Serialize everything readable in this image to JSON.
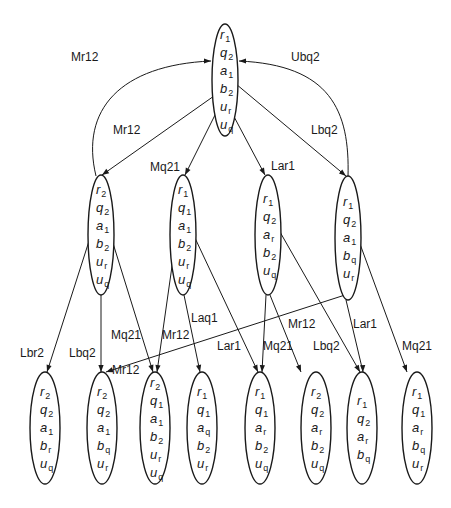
{
  "diagram": {
    "type": "state-transition-tree",
    "colors": {
      "stroke": "#1a1a1a",
      "background": "#ffffff"
    },
    "nodes": [
      {
        "id": "root",
        "cx": 225,
        "cy": 80,
        "rx": 13,
        "ry": 56,
        "vars": [
          [
            "r",
            "1"
          ],
          [
            "q",
            "2"
          ],
          [
            "a",
            "1"
          ],
          [
            "b",
            "2"
          ],
          [
            "u",
            "r"
          ],
          [
            "u",
            "q"
          ]
        ]
      },
      {
        "id": "m1",
        "cx": 101,
        "cy": 235,
        "rx": 13,
        "ry": 60,
        "vars": [
          [
            "r",
            "2"
          ],
          [
            "q",
            "2"
          ],
          [
            "a",
            "1"
          ],
          [
            "b",
            "2"
          ],
          [
            "u",
            "r"
          ],
          [
            "u",
            "q"
          ]
        ]
      },
      {
        "id": "m2",
        "cx": 183,
        "cy": 235,
        "rx": 13,
        "ry": 60,
        "vars": [
          [
            "r",
            "1"
          ],
          [
            "q",
            "1"
          ],
          [
            "a",
            "1"
          ],
          [
            "b",
            "2"
          ],
          [
            "u",
            "r"
          ],
          [
            "u",
            "q"
          ]
        ]
      },
      {
        "id": "m3",
        "cx": 268,
        "cy": 235,
        "rx": 13,
        "ry": 60,
        "vars": [
          [
            "r",
            "1"
          ],
          [
            "q",
            "2"
          ],
          [
            "a",
            "r"
          ],
          [
            "b",
            "2"
          ],
          [
            "u",
            "q"
          ]
        ]
      },
      {
        "id": "m4",
        "cx": 348,
        "cy": 238,
        "rx": 13,
        "ry": 62,
        "vars": [
          [
            "r",
            "1"
          ],
          [
            "q",
            "2"
          ],
          [
            "a",
            "1"
          ],
          [
            "b",
            "q"
          ],
          [
            "u",
            "r"
          ]
        ]
      },
      {
        "id": "b1",
        "cx": 45,
        "cy": 428,
        "rx": 15,
        "ry": 56,
        "vars": [
          [
            "r",
            "2"
          ],
          [
            "q",
            "2"
          ],
          [
            "a",
            "1"
          ],
          [
            "b",
            "r"
          ],
          [
            "u",
            "q"
          ]
        ]
      },
      {
        "id": "b2",
        "cx": 102,
        "cy": 428,
        "rx": 15,
        "ry": 56,
        "vars": [
          [
            "r",
            "2"
          ],
          [
            "q",
            "2"
          ],
          [
            "a",
            "1"
          ],
          [
            "b",
            "q"
          ],
          [
            "u",
            "r"
          ]
        ]
      },
      {
        "id": "b3",
        "cx": 155,
        "cy": 428,
        "rx": 15,
        "ry": 56,
        "vars": [
          [
            "r",
            "2"
          ],
          [
            "q",
            "1"
          ],
          [
            "a",
            "1"
          ],
          [
            "b",
            "2"
          ],
          [
            "u",
            "r"
          ],
          [
            "u",
            "q"
          ]
        ]
      },
      {
        "id": "b4",
        "cx": 202,
        "cy": 428,
        "rx": 15,
        "ry": 56,
        "vars": [
          [
            "r",
            "1"
          ],
          [
            "q",
            "1"
          ],
          [
            "a",
            "q"
          ],
          [
            "b",
            "2"
          ],
          [
            "u",
            "r"
          ]
        ]
      },
      {
        "id": "b5",
        "cx": 260,
        "cy": 428,
        "rx": 15,
        "ry": 56,
        "vars": [
          [
            "r",
            "1"
          ],
          [
            "q",
            "1"
          ],
          [
            "a",
            "r"
          ],
          [
            "b",
            "2"
          ],
          [
            "u",
            "q"
          ]
        ]
      },
      {
        "id": "b6",
        "cx": 316,
        "cy": 428,
        "rx": 15,
        "ry": 56,
        "vars": [
          [
            "r",
            "2"
          ],
          [
            "q",
            "2"
          ],
          [
            "a",
            "r"
          ],
          [
            "b",
            "2"
          ],
          [
            "u",
            "q"
          ]
        ]
      },
      {
        "id": "b7",
        "cx": 362,
        "cy": 428,
        "rx": 15,
        "ry": 56,
        "vars": [
          [
            "r",
            "1"
          ],
          [
            "q",
            "2"
          ],
          [
            "a",
            "r"
          ],
          [
            "b",
            "q"
          ]
        ]
      },
      {
        "id": "b8",
        "cx": 417,
        "cy": 428,
        "rx": 15,
        "ry": 56,
        "vars": [
          [
            "r",
            "1"
          ],
          [
            "q",
            "1"
          ],
          [
            "a",
            "r"
          ],
          [
            "b",
            "q"
          ],
          [
            "u",
            "r"
          ]
        ]
      }
    ],
    "edges": [
      {
        "label": "Mr12",
        "path": "M96,176 C80,110 120,65 211,61",
        "arrow_at": [
          211,
          61
        ],
        "arrow_dir": [
          1,
          0
        ],
        "label_pos": [
          71,
          61
        ]
      },
      {
        "label": "Ubq2",
        "path": "M348,177 C350,110 330,65 239,61",
        "arrow_at": [
          239,
          61
        ],
        "arrow_dir": [
          -1,
          0
        ],
        "label_pos": [
          291,
          61
        ]
      },
      {
        "label": "Mr12",
        "path": "M214,96 L102,175",
        "arrow_at": [
          102,
          175
        ],
        "arrow_dir": [
          -0.82,
          0.57
        ],
        "label_pos": [
          113,
          134
        ]
      },
      {
        "label": "Mq21",
        "path": "M216,113 L185,175",
        "arrow_at": [
          185,
          175
        ],
        "arrow_dir": [
          -0.45,
          0.89
        ],
        "label_pos": [
          150,
          171
        ]
      },
      {
        "label": "Lar1",
        "path": "M231,111 L265,175",
        "arrow_at": [
          265,
          175
        ],
        "arrow_dir": [
          0.47,
          0.88
        ],
        "label_pos": [
          271,
          170
        ]
      },
      {
        "label": "Lbq2",
        "path": "M236,84 L346,176",
        "arrow_at": [
          346,
          176
        ],
        "arrow_dir": [
          0.77,
          0.64
        ],
        "label_pos": [
          311,
          134
        ]
      },
      {
        "label": "Lbr2",
        "path": "M90,238 L47,372",
        "arrow_at": [
          47,
          372
        ],
        "arrow_dir": [
          -0.3,
          0.95
        ],
        "label_pos": [
          20,
          357
        ]
      },
      {
        "label": "Lbq2",
        "path": "M101,295 L101,372",
        "arrow_at": [
          101,
          372
        ],
        "arrow_dir": [
          0,
          1
        ],
        "label_pos": [
          69,
          357
        ]
      },
      {
        "label": "Mq21",
        "path": "M112,240 L153,372",
        "arrow_at": [
          153,
          372
        ],
        "arrow_dir": [
          0.3,
          0.95
        ],
        "label_pos": [
          111,
          339
        ]
      },
      {
        "label": "Mr12",
        "path": "M176,238 L157,372",
        "arrow_at": [
          157,
          372
        ],
        "arrow_dir": [
          -0.14,
          0.99
        ],
        "label_pos": [
          162,
          339
        ]
      },
      {
        "label": "Laq1",
        "path": "M184,295 L200,372",
        "arrow_at": [
          200,
          372
        ],
        "arrow_dir": [
          0.2,
          0.98
        ],
        "label_pos": [
          191,
          322
        ]
      },
      {
        "label": "Lar1",
        "path": "M195,238 L258,372",
        "arrow_at": [
          258,
          372
        ],
        "arrow_dir": [
          0.43,
          0.9
        ],
        "label_pos": [
          217,
          350
        ]
      },
      {
        "label": "Mq21",
        "path": "M266,295 L262,372",
        "arrow_at": [
          262,
          372
        ],
        "arrow_dir": [
          -0.05,
          1
        ],
        "label_pos": [
          263,
          350
        ]
      },
      {
        "label": "Mr12",
        "path": "M270,295 L301,372",
        "arrow_at": [
          301,
          372
        ],
        "arrow_dir": [
          0.37,
          0.93
        ],
        "label_pos": [
          288,
          328
        ]
      },
      {
        "label": "Lbq2",
        "path": "M280,232 L360,372",
        "arrow_at": [
          360,
          372
        ],
        "arrow_dir": [
          0.5,
          0.87
        ],
        "label_pos": [
          313,
          350
        ]
      },
      {
        "label": "Lar1",
        "path": "M346,300 L363,372",
        "arrow_at": [
          363,
          372
        ],
        "arrow_dir": [
          0.05,
          1
        ],
        "label_pos": [
          353,
          328
        ]
      },
      {
        "label": "Mq21",
        "path": "M360,244 L407,372",
        "arrow_at": [
          407,
          372
        ],
        "arrow_dir": [
          0.35,
          0.94
        ],
        "label_pos": [
          402,
          350
        ]
      },
      {
        "label": "Mr12",
        "path": "M345,295 L106,372",
        "arrow_at": [
          106,
          372
        ],
        "arrow_dir": [
          -0.95,
          0.31
        ],
        "label_pos": [
          112,
          374
        ]
      }
    ]
  }
}
